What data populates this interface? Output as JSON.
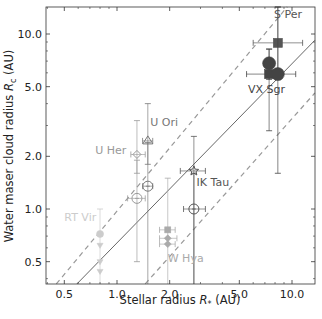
{
  "chart_data": {
    "type": "scatter",
    "title": "",
    "xlabel": "Stellar radius R* (AU)",
    "ylabel": "Water maser cloud radius Rc (AU)",
    "xscale": "log",
    "yscale": "log",
    "xlim": [
      0.39,
      13.5
    ],
    "ylim": [
      0.37,
      14.3
    ],
    "grid": false,
    "legend": null,
    "xticks": [
      {
        "value": 0.5,
        "label": "0.5"
      },
      {
        "value": 1.0,
        "label": "1.0"
      },
      {
        "value": 2.0,
        "label": "2.0"
      },
      {
        "value": 5.0,
        "label": "5.0"
      },
      {
        "value": 10.0,
        "label": "10.0"
      }
    ],
    "yticks": [
      {
        "value": 0.5,
        "label": "0.5"
      },
      {
        "value": 1.0,
        "label": "1.0"
      },
      {
        "value": 2.0,
        "label": "2.0"
      },
      {
        "value": 5.0,
        "label": "5.0"
      },
      {
        "value": 10.0,
        "label": "10.0"
      }
    ],
    "reference_lines": [
      {
        "name": "solid-fit",
        "style": "solid",
        "color": "#555555",
        "from": [
          0.59,
          0.373
        ],
        "to": [
          13.5,
          9.2
        ]
      },
      {
        "name": "upper-dashed",
        "style": "dashed",
        "color": "#999999",
        "from": [
          0.45,
          0.373
        ],
        "to": [
          9.4,
          14.3
        ]
      },
      {
        "name": "lower-dashed",
        "style": "dashed",
        "color": "#999999",
        "from": [
          1.45,
          0.373
        ],
        "to": [
          13.5,
          4.6
        ]
      }
    ],
    "stars": [
      {
        "name": "S Per",
        "color": "#555555",
        "label_pos": [
          7.9,
          12.4
        ],
        "points": [
          {
            "x": 8.3,
            "y": 8.9,
            "marker": "square",
            "xerr": [
              6.0,
              11.5
            ],
            "yerr": [
              5.5,
              14.3
            ]
          }
        ]
      },
      {
        "name": "VX Sgr",
        "color": "#444444",
        "label_pos": [
          5.6,
          4.6
        ],
        "points": [
          {
            "x": 7.4,
            "y": 6.8,
            "marker": "circle",
            "xerr": null,
            "yerr": [
              5.5,
              8.2
            ]
          },
          {
            "x": 7.4,
            "y": 5.9,
            "marker": "square",
            "xerr": [
              5.5,
              10.5
            ],
            "yerr": [
              2.8,
              8.2
            ]
          },
          {
            "x": 8.3,
            "y": 5.9,
            "marker": "circle",
            "xerr": null,
            "yerr": [
              1.6,
              14.3
            ]
          }
        ]
      },
      {
        "name": "U Ori",
        "color": "#777777",
        "label_pos": [
          1.55,
          3.0
        ],
        "points": [
          {
            "x": 1.5,
            "y": 2.45,
            "marker": "triangle-open",
            "xerr": [
              1.4,
              1.6
            ],
            "yerr": [
              1.8,
              4.0
            ]
          },
          {
            "x": 1.5,
            "y": 1.35,
            "marker": "circle-open",
            "xerr": [
              1.4,
              1.6
            ],
            "yerr": [
              0.37,
              2.4
            ]
          }
        ]
      },
      {
        "name": "U Her",
        "color": "#999999",
        "label_pos": [
          0.75,
          2.05
        ],
        "points": [
          {
            "x": 1.3,
            "y": 2.05,
            "marker": "diamond-open",
            "xerr": [
              1.2,
              1.45
            ],
            "yerr": [
              1.6,
              3.2
            ]
          },
          {
            "x": 1.3,
            "y": 1.15,
            "marker": "circle-open",
            "xerr": [
              1.15,
              1.45
            ],
            "yerr": [
              0.5,
              1.9
            ]
          }
        ]
      },
      {
        "name": "IK Tau",
        "color": "#555555",
        "label_pos": [
          2.85,
          1.35
        ],
        "points": [
          {
            "x": 2.75,
            "y": 1.65,
            "marker": "star-open",
            "xerr": [
              2.3,
              3.2
            ],
            "yerr": [
              0.37,
              2.6
            ]
          },
          {
            "x": 2.75,
            "y": 1.0,
            "marker": "circle-open",
            "xerr": [
              2.4,
              3.2
            ],
            "yerr": [
              0.37,
              1.6
            ]
          }
        ]
      },
      {
        "name": "W Hya",
        "color": "#aaaaaa",
        "label_pos": [
          1.95,
          0.5
        ],
        "points": [
          {
            "x": 1.95,
            "y": 0.76,
            "marker": "square",
            "xerr": [
              1.75,
              2.15
            ],
            "yerr": null
          },
          {
            "x": 1.95,
            "y": 0.68,
            "marker": "diamond",
            "xerr": [
              1.75,
              2.2
            ],
            "yerr": null
          },
          {
            "x": 1.95,
            "y": 0.63,
            "marker": "diamond",
            "xerr": [
              1.75,
              2.15
            ],
            "yerr": [
              0.37,
              1.5
            ]
          }
        ]
      },
      {
        "name": "RT Vir",
        "color": "#cccccc",
        "label_pos": [
          0.5,
          0.85
        ],
        "points": [
          {
            "x": 0.8,
            "y": 0.72,
            "marker": "circle",
            "xerr": null,
            "yerr": [
              0.37,
              1.0
            ]
          },
          {
            "x": 0.8,
            "y": 0.62,
            "marker": "triangle-down",
            "xerr": null,
            "yerr": null
          },
          {
            "x": 0.8,
            "y": 0.5,
            "marker": "triangle-down",
            "xerr": null,
            "yerr": null
          },
          {
            "x": 0.8,
            "y": 0.44,
            "marker": "triangle-down",
            "xerr": null,
            "yerr": null
          }
        ]
      }
    ]
  },
  "labels": {
    "xlabel_main": "Stellar radius ",
    "xlabel_sym": "R",
    "xlabel_sub": "*",
    "xlabel_unit": " (AU)",
    "ylabel_main": "Water maser cloud radius ",
    "ylabel_sym": "R",
    "ylabel_sub": "c",
    "ylabel_unit": " (AU)"
  }
}
